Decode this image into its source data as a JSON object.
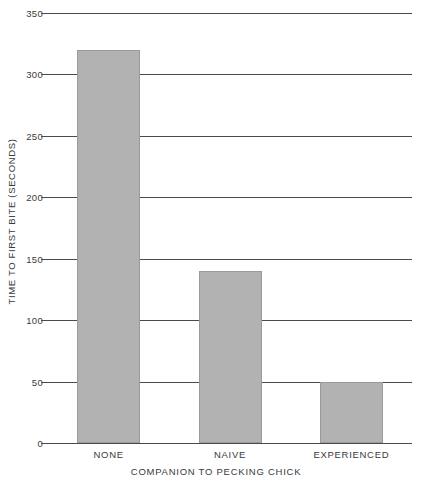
{
  "chart_data": {
    "type": "bar",
    "title": "",
    "subtitle": "",
    "categories": [
      "NONE",
      "NAIVE",
      "EXPERIENCED"
    ],
    "values": [
      320,
      140,
      50
    ],
    "xlabel": "COMPANION TO PECKING CHICK",
    "ylabel": "TIME TO FIRST BITE (SECONDS)",
    "ylim": [
      0,
      350
    ],
    "ytick_values": [
      0,
      50,
      100,
      150,
      200,
      250,
      300,
      350
    ],
    "ytick_labels": [
      "0",
      "50",
      "100",
      "150",
      "200",
      "250",
      "300",
      "350"
    ],
    "xlim": [
      0,
      3
    ],
    "grid": "horizontal",
    "legend": "none",
    "bar_color": "#b2b2b2",
    "bar_edge_color": "#9a9a9a",
    "axis_color": "#4a4a4a",
    "text_color": "#3a3a3a",
    "background_color": "#ffffff",
    "annotations": []
  }
}
